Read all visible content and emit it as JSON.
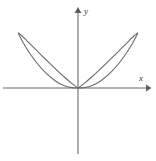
{
  "figure": {
    "title": "",
    "width": 156,
    "height": 161,
    "background_color": "#ffffff"
  },
  "axes": {
    "x_axis": {
      "label": "x",
      "color": "#6b6b6b",
      "start_px": 3,
      "end_px": 149,
      "y_px": 88,
      "arrow": "right-arrow"
    },
    "y_axis": {
      "label": "y",
      "color": "#6b6b6b",
      "top_px": 9,
      "bottom_px": 154,
      "x_px": 78,
      "arrow": "up-arrow"
    }
  },
  "chart_data": {
    "type": "line",
    "title": "",
    "subtitle": "",
    "xlabel": "x",
    "ylabel": "y",
    "curve_name": "two-petal polar rose",
    "equation": "r = a sin(2θ)",
    "curve_color": "#6b6b6b",
    "curve_width": 1.1,
    "grid": false,
    "legend": null,
    "xlim": [
      -1.45,
      1.45
    ],
    "ylim": [
      -1.65,
      1.6
    ],
    "origin_px": [
      78,
      88
    ],
    "scale_px_per_unit": [
      52,
      52
    ],
    "annotations": [],
    "tick_labels": {
      "x": [],
      "y": []
    },
    "petals": [
      {
        "name": "left-petal",
        "tip_data": [
          -1.18,
          0.57
        ],
        "tip_px": [
          17,
          58
        ],
        "max_height_data": 0.77,
        "angle_deg": 154
      },
      {
        "name": "right-petal",
        "tip_data": [
          1.16,
          0.58
        ],
        "tip_px": [
          138,
          58
        ],
        "max_height_data": 0.77,
        "angle_deg": 26
      }
    ],
    "series": [
      {
        "name": "rose-curve",
        "closed": true,
        "x": [
          0.0,
          0.121,
          0.275,
          0.448,
          0.625,
          0.791,
          0.935,
          1.046,
          1.118,
          1.147,
          1.132,
          1.075,
          0.982,
          0.859,
          0.716,
          0.562,
          0.408,
          0.263,
          0.134,
          0.032,
          0.0,
          -0.032,
          -0.134,
          -0.263,
          -0.408,
          -0.562,
          -0.716,
          -0.859,
          -0.982,
          -1.075,
          -1.132,
          -1.147,
          -1.118,
          -1.046,
          -0.935,
          -0.791,
          -0.625,
          -0.448,
          -0.275,
          -0.121,
          0.0
        ],
        "y": [
          0.0,
          0.007,
          0.049,
          0.145,
          0.294,
          0.481,
          0.679,
          0.857,
          0.989,
          1.055,
          1.047,
          1.0,
          0.908,
          0.785,
          0.643,
          0.493,
          0.345,
          0.211,
          0.1,
          0.021,
          0.0,
          0.021,
          0.1,
          0.211,
          0.345,
          0.493,
          0.643,
          0.785,
          0.908,
          1.0,
          1.047,
          1.055,
          0.989,
          0.857,
          0.679,
          0.481,
          0.294,
          0.145,
          0.049,
          0.007,
          0.0
        ]
      }
    ]
  },
  "icons": {
    "x_arrow": "right-arrow-icon",
    "y_arrow": "up-arrow-icon"
  }
}
